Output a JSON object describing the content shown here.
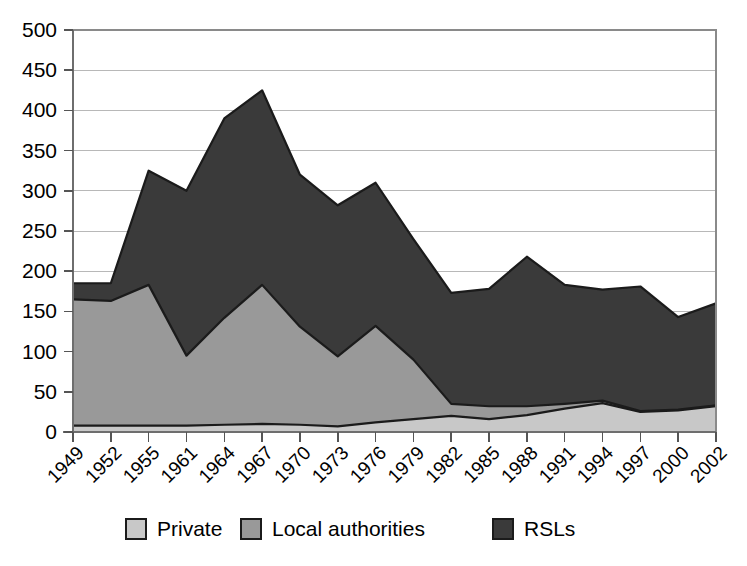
{
  "chart_data": {
    "type": "area",
    "stacked": true,
    "title": "",
    "subtitle": "",
    "xlabel": "",
    "ylabel": "",
    "grid": true,
    "legend_position": "bottom",
    "ylim": [
      0,
      500
    ],
    "yticks": [
      0,
      50,
      100,
      150,
      200,
      250,
      300,
      350,
      400,
      450,
      500
    ],
    "ytick_labels": [
      "0",
      "50",
      "100",
      "150",
      "200",
      "250",
      "300",
      "350",
      "400",
      "450",
      "500"
    ],
    "categories": [
      "1949",
      "1952",
      "1955",
      "1961",
      "1964",
      "1967",
      "1970",
      "1973",
      "1976",
      "1979",
      "1982",
      "1985",
      "1988",
      "1991",
      "1994",
      "1997",
      "2000",
      "2002"
    ],
    "xtick_labels": [
      "1949",
      "1952",
      "1955",
      "1961",
      "1964",
      "1967",
      "1970",
      "1973",
      "1976",
      "1979",
      "1982",
      "1985",
      "1988",
      "1991",
      "1994",
      "1997",
      "2000",
      "2002"
    ],
    "series": [
      {
        "name": "Private",
        "color": "#c8c8c8",
        "values": [
          8,
          8,
          8,
          8,
          9,
          10,
          9,
          7,
          12,
          16,
          20,
          16,
          21,
          29,
          36,
          25,
          27,
          32
        ]
      },
      {
        "name": "Local authorities",
        "color": "#999999",
        "values": [
          157,
          155,
          175,
          87,
          133,
          173,
          122,
          87,
          120,
          74,
          15,
          16,
          11,
          6,
          3,
          1,
          1,
          1
        ]
      },
      {
        "name": "RSLs",
        "color": "#3a3a3a",
        "values": [
          20,
          22,
          142,
          205,
          248,
          242,
          189,
          188,
          178,
          150,
          138,
          146,
          186,
          148,
          138,
          155,
          115,
          127
        ]
      }
    ],
    "totals": [
      185,
      185,
      325,
      300,
      390,
      425,
      320,
      282,
      310,
      240,
      173,
      178,
      218,
      183,
      177,
      181,
      143,
      160
    ]
  },
  "legend": {
    "entries": [
      {
        "label": "Private",
        "color": "#c8c8c8"
      },
      {
        "label": "Local authorities",
        "color": "#999999"
      },
      {
        "label": "RSLs",
        "color": "#3a3a3a"
      }
    ]
  },
  "axis": {
    "y_max_label": "500",
    "y_min_label": "0"
  }
}
